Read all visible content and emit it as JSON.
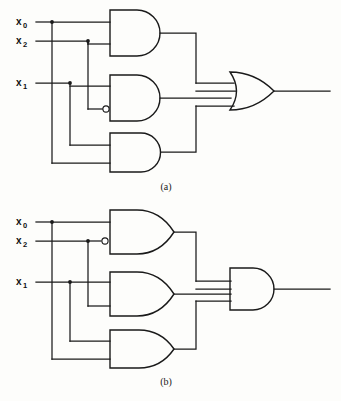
{
  "figure": {
    "title_visible": false,
    "background_color": "#fdfdfb",
    "line_color": "#1a1a1a",
    "width": 341,
    "height": 401
  },
  "panels": [
    {
      "id": "panel-a",
      "caption": "(a)",
      "caption_x": 166,
      "caption_y": 190,
      "inputs": [
        {
          "name": "x0",
          "base": "x",
          "sub": "0",
          "label_x": 16,
          "label_y": 25,
          "wire_y": 22
        },
        {
          "name": "x2",
          "base": "x",
          "sub": "2",
          "label_x": 16,
          "label_y": 44,
          "wire_y": 41
        },
        {
          "name": "x1",
          "base": "x",
          "sub": "1",
          "label_x": 16,
          "label_y": 86,
          "wire_y": 83
        }
      ],
      "gates": [
        {
          "id": "a-g1",
          "type": "AND",
          "inputs": 2,
          "inverted_inputs": [],
          "x": 110,
          "y": 10,
          "w": 54,
          "h": 46
        },
        {
          "id": "a-g2",
          "type": "AND",
          "inputs": 2,
          "inverted_inputs": [
            1
          ],
          "x": 110,
          "y": 75,
          "w": 54,
          "h": 46
        },
        {
          "id": "a-g3",
          "type": "AND",
          "inputs": 2,
          "inverted_inputs": [],
          "x": 110,
          "y": 133,
          "w": 54,
          "h": 39
        },
        {
          "id": "a-out",
          "type": "OR",
          "inputs": 3,
          "inverted_inputs": [],
          "x": 230,
          "y": 72,
          "w": 44,
          "h": 38
        }
      ],
      "output_wire": {
        "from_x": 274,
        "to_x": 330,
        "y": 91
      }
    },
    {
      "id": "panel-b",
      "caption": "(b)",
      "caption_x": 166,
      "caption_y": 385,
      "inputs": [
        {
          "name": "x0",
          "base": "x",
          "sub": "0",
          "label_x": 16,
          "label_y": 225,
          "wire_y": 222
        },
        {
          "name": "x2",
          "base": "x",
          "sub": "2",
          "label_x": 16,
          "label_y": 244,
          "wire_y": 241
        },
        {
          "name": "x1",
          "base": "x",
          "sub": "1",
          "label_x": 16,
          "label_y": 285,
          "wire_y": 282
        }
      ],
      "gates": [
        {
          "id": "b-g1",
          "type": "OR",
          "inputs": 2,
          "inverted_inputs": [
            1
          ],
          "x": 110,
          "y": 210,
          "w": 54,
          "h": 44
        },
        {
          "id": "b-g2",
          "type": "OR",
          "inputs": 2,
          "inverted_inputs": [],
          "x": 110,
          "y": 272,
          "w": 54,
          "h": 44
        },
        {
          "id": "b-g3",
          "type": "OR",
          "inputs": 2,
          "inverted_inputs": [],
          "x": 110,
          "y": 330,
          "w": 54,
          "h": 38
        },
        {
          "id": "b-out",
          "type": "AND",
          "inputs": 3,
          "inverted_inputs": [],
          "x": 230,
          "y": 268,
          "w": 44,
          "h": 42
        }
      ],
      "output_wire": {
        "from_x": 274,
        "to_x": 330,
        "y": 289
      }
    }
  ],
  "junction_dots": [
    {
      "panel": "a",
      "x": 52,
      "y": 22
    },
    {
      "panel": "a",
      "x": 88,
      "y": 41
    },
    {
      "panel": "a",
      "x": 70,
      "y": 83
    },
    {
      "panel": "b",
      "x": 52,
      "y": 222
    },
    {
      "panel": "b",
      "x": 88,
      "y": 241
    },
    {
      "panel": "b",
      "x": 70,
      "y": 282
    }
  ],
  "legend": {
    "gate_types": [
      "AND",
      "OR"
    ],
    "bubble_meaning": "inversion"
  }
}
